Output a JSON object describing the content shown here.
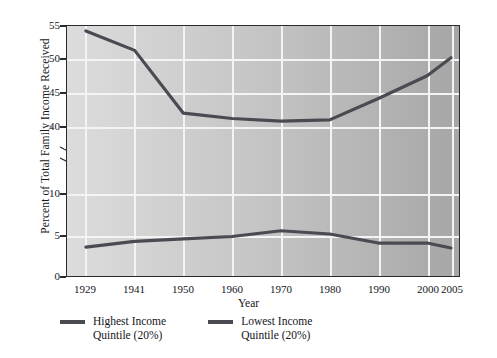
{
  "chart_data": {
    "type": "line",
    "title": "",
    "xlabel": "Year",
    "ylabel": "Percent of Total Family Income Received",
    "x": [
      1929,
      1941,
      1950,
      1960,
      1970,
      1980,
      1990,
      2000,
      2005
    ],
    "categories": [
      "1929",
      "1941",
      "1950",
      "1960",
      "1970",
      "1980",
      "1990",
      "2000",
      "2005"
    ],
    "series": [
      {
        "name": "Highest Income Quintile (20%)",
        "color": "#4a4a52",
        "values": [
          54.4,
          51.5,
          42.1,
          41.3,
          40.9,
          41.1,
          44.3,
          47.7,
          50.4
        ]
      },
      {
        "name": "Lowest Income Quintile (20%)",
        "color": "#4a4a52",
        "values": [
          3.5,
          4.2,
          4.5,
          4.8,
          5.5,
          5.1,
          4.0,
          4.0,
          3.4
        ]
      }
    ],
    "y_axis": {
      "broken": true,
      "lower_segment": {
        "min": 0,
        "max": 10,
        "ticks": [
          0,
          5,
          10
        ]
      },
      "upper_segment": {
        "min": 40,
        "max": 55,
        "ticks": [
          40,
          45,
          50,
          55
        ]
      },
      "tick_labels": [
        "0",
        "5",
        "10",
        "40",
        "45",
        "50",
        "55"
      ]
    },
    "x_axis": {
      "tick_labels": [
        "1929",
        "1941",
        "1950",
        "1960",
        "1970",
        "1980",
        "1990",
        "2000",
        "2005"
      ]
    },
    "grid": true,
    "legend_position": "bottom",
    "plot_background": "gradient light-gray to dark-gray, left to right"
  },
  "axis": {
    "y_title": "Percent of Total Family Income Received",
    "x_title": "Year",
    "y_ticks": [
      {
        "label": "55",
        "y": 26
      },
      {
        "label": "50",
        "y": 59
      },
      {
        "label": "45",
        "y": 93
      },
      {
        "label": "40",
        "y": 127
      },
      {
        "label": "10",
        "y": 194
      },
      {
        "label": "5",
        "y": 236
      },
      {
        "label": "0",
        "y": 277
      }
    ],
    "x_ticks": [
      {
        "label": "1929",
        "x": 85
      },
      {
        "label": "1941",
        "x": 134
      },
      {
        "label": "1950",
        "x": 183
      },
      {
        "label": "1960",
        "x": 232
      },
      {
        "label": "1970",
        "x": 281
      },
      {
        "label": "1980",
        "x": 330
      },
      {
        "label": "1990",
        "x": 379
      },
      {
        "label": "2000",
        "x": 428
      },
      {
        "label": "2005",
        "x": 452
      }
    ]
  },
  "legend": {
    "items": [
      {
        "label": "Highest Income\nQuintile (20%)",
        "color": "#4a4a52"
      },
      {
        "label": "Lowest Income\nQuintile (20%)",
        "color": "#4a4a52"
      }
    ]
  },
  "colors": {
    "line": "#4a4a52",
    "grid": "#f4f4f4",
    "frame": "#2a2a30",
    "text": "#15151a"
  }
}
